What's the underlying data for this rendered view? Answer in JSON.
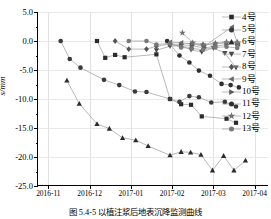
{
  "figure": {
    "caption": "图 5.4-5  以植注浆后地表沉降监测曲线"
  },
  "chart_data": {
    "type": "line",
    "title": "",
    "xlabel": "",
    "ylabel": "s/mm",
    "ylim": [
      -25.0,
      5.0
    ],
    "yticks": [
      "5.0",
      "0.0",
      "-5.0",
      "-10.0",
      "-15.0",
      "-20.0",
      "-25.0"
    ],
    "ytick_values": [
      5.0,
      0.0,
      -5.0,
      -10.0,
      -15.0,
      -20.0,
      -25.0
    ],
    "xticks": [
      "2016-11",
      "2016-12",
      "2017-01",
      "2017-02",
      "2017-03",
      "2017-04"
    ],
    "xtick_values": [
      0,
      1,
      2,
      3,
      4,
      5
    ],
    "xlim": [
      -0.25,
      5.35
    ],
    "grid": true,
    "legend_position": "right-outside",
    "series": [
      {
        "name": "4号",
        "marker": "square",
        "color": "#2b2b2b",
        "points": [
          [
            1.18,
            0.0
          ],
          [
            1.38,
            -2.9
          ],
          [
            1.62,
            -2.4
          ],
          [
            1.85,
            -2.8
          ],
          [
            2.62,
            -2.3
          ],
          [
            2.95,
            -10.0
          ],
          [
            3.22,
            -10.9
          ],
          [
            3.46,
            -11.0
          ],
          [
            3.72,
            -13.0
          ],
          [
            4.32,
            -13.4
          ],
          [
            4.55,
            -14.1
          ]
        ]
      },
      {
        "name": "5号",
        "marker": "circle",
        "color": "#3a3a3a",
        "points": [
          [
            0.3,
            0.0
          ],
          [
            0.52,
            -3.1
          ],
          [
            0.78,
            -4.6
          ],
          [
            1.35,
            -6.7
          ],
          [
            1.72,
            -7.6
          ],
          [
            2.1,
            -8.7
          ],
          [
            2.38,
            -8.8
          ],
          [
            2.95,
            -10.0
          ],
          [
            3.18,
            -10.5
          ],
          [
            3.42,
            -9.5
          ],
          [
            3.65,
            -9.7
          ],
          [
            3.95,
            -10.6
          ],
          [
            4.28,
            -10.5
          ],
          [
            4.55,
            -11.3
          ]
        ]
      },
      {
        "name": "6号",
        "marker": "triangle-up",
        "color": "#2b2b2b",
        "points": [
          [
            0.45,
            -6.8
          ],
          [
            0.75,
            -10.8
          ],
          [
            1.18,
            -14.3
          ],
          [
            1.48,
            -15.1
          ],
          [
            1.8,
            -16.7
          ],
          [
            2.12,
            -17.1
          ],
          [
            2.42,
            -18.1
          ],
          [
            2.95,
            -19.7
          ],
          [
            3.22,
            -19.1
          ],
          [
            3.45,
            -19.2
          ],
          [
            3.7,
            -19.6
          ],
          [
            3.98,
            -22.3
          ],
          [
            4.25,
            -19.8
          ],
          [
            4.5,
            -22.3
          ],
          [
            4.78,
            -20.6
          ]
        ]
      },
      {
        "name": "7号",
        "marker": "triangle-down",
        "color": "#4a4a4a",
        "points": [
          [
            2.62,
            -1.6
          ],
          [
            2.95,
            -0.9
          ],
          [
            3.22,
            -0.8
          ],
          [
            3.46,
            -1.5
          ],
          [
            3.72,
            -1.9
          ],
          [
            4.0,
            -1.2
          ],
          [
            4.28,
            -2.1
          ],
          [
            4.55,
            -4.6
          ]
        ]
      },
      {
        "name": "8号",
        "marker": "diamond",
        "color": "#555555",
        "points": [
          [
            1.62,
            0.0
          ],
          [
            1.95,
            -1.4
          ],
          [
            2.38,
            -1.4
          ],
          [
            2.62,
            -0.9
          ],
          [
            2.95,
            -0.5
          ],
          [
            3.22,
            -0.6
          ],
          [
            3.48,
            -0.4
          ],
          [
            3.75,
            -0.7
          ],
          [
            4.05,
            -0.5
          ],
          [
            4.32,
            -0.3
          ],
          [
            4.58,
            -0.2
          ]
        ]
      },
      {
        "name": "9号",
        "marker": "triangle-left",
        "color": "#6a6a6a",
        "points": [
          [
            2.95,
            -0.2
          ],
          [
            3.22,
            -0.3
          ],
          [
            3.48,
            -0.5
          ],
          [
            3.78,
            -0.9
          ],
          [
            4.45,
            2.4
          ],
          [
            4.6,
            -0.6
          ]
        ]
      },
      {
        "name": "10号",
        "marker": "triangle-right",
        "color": "#5a5a5a",
        "points": [
          [
            2.95,
            -0.6
          ],
          [
            3.22,
            -0.9
          ],
          [
            3.48,
            -0.8
          ],
          [
            3.78,
            -1.2
          ],
          [
            4.05,
            -0.9
          ],
          [
            4.32,
            -0.6
          ],
          [
            4.58,
            -0.5
          ]
        ]
      },
      {
        "name": "11号",
        "marker": "circle",
        "color": "#2f2f2f",
        "points": [
          [
            2.88,
            0.0
          ],
          [
            3.18,
            -2.5
          ],
          [
            3.42,
            -3.7
          ],
          [
            3.65,
            -5.1
          ],
          [
            3.92,
            -6.0
          ],
          [
            4.2,
            -7.4
          ],
          [
            4.42,
            -7.6
          ],
          [
            4.62,
            -8.0
          ]
        ]
      },
      {
        "name": "12号",
        "marker": "star",
        "color": "#707070",
        "points": [
          [
            3.25,
            1.4
          ],
          [
            3.5,
            -0.3
          ],
          [
            3.75,
            -0.6
          ],
          [
            4.05,
            -0.4
          ],
          [
            4.32,
            -0.2
          ],
          [
            4.58,
            -0.3
          ]
        ]
      },
      {
        "name": "13号",
        "marker": "circle-gray",
        "color": "#787878",
        "points": [
          [
            1.95,
            0.0
          ],
          [
            2.38,
            0.0
          ],
          [
            2.62,
            -0.6
          ],
          [
            2.95,
            -0.4
          ],
          [
            3.22,
            -1.1
          ],
          [
            3.48,
            -1.3
          ],
          [
            3.75,
            -1.5
          ],
          [
            4.05,
            -1.1
          ],
          [
            4.32,
            -1.0
          ],
          [
            4.58,
            -1.2
          ]
        ]
      }
    ]
  },
  "legend": {
    "items": [
      {
        "label": "4号",
        "marker": "square"
      },
      {
        "label": "5号",
        "marker": "circle"
      },
      {
        "label": "6号",
        "marker": "triangle-up"
      },
      {
        "label": "7号",
        "marker": "triangle-down"
      },
      {
        "label": "8号",
        "marker": "diamond"
      },
      {
        "label": "9号",
        "marker": "triangle-left"
      },
      {
        "label": "10号",
        "marker": "triangle-right"
      },
      {
        "label": "11号",
        "marker": "circle"
      },
      {
        "label": "12号",
        "marker": "star"
      },
      {
        "label": "13号",
        "marker": "circle-gray"
      }
    ]
  }
}
